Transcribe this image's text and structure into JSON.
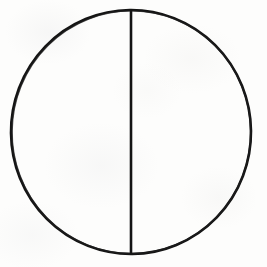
{
  "figure": {
    "name": "bisected-circle",
    "canvas": {
      "width": 267,
      "height": 267,
      "background_color": "#fdfdfc"
    },
    "ink_color": "#141414",
    "shapes": [
      {
        "id": "circle-outline",
        "type": "circle",
        "center_x": 131,
        "center_y": 132,
        "radius_x": 120,
        "radius_y": 122,
        "stroke_width": 2.6,
        "fill": "none"
      },
      {
        "id": "vertical-diameter",
        "type": "line",
        "x1": 131,
        "y1": 10,
        "x2": 131,
        "y2": 254,
        "stroke_width": 2.6
      }
    ],
    "labels": [],
    "annotations": []
  }
}
